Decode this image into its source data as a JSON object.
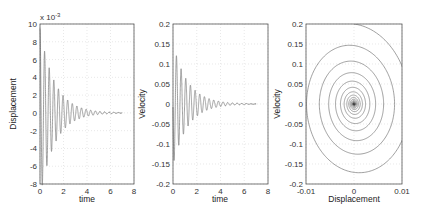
{
  "chart_data": [
    {
      "type": "line",
      "title": "",
      "xlabel": "time",
      "ylabel": "Displacement",
      "exponent_label": "x 10",
      "exponent": "-3",
      "xlim": [
        0,
        8
      ],
      "ylim": [
        -8,
        10
      ],
      "xticks": [
        "0",
        "2",
        "4",
        "6",
        "8"
      ],
      "yticks": [
        "-8",
        "-6",
        "-4",
        "-2",
        "0",
        "2",
        "4",
        "6",
        "8",
        "10"
      ],
      "grid": true,
      "series": [
        {
          "name": "displacement",
          "model": "damped_cos",
          "amplitude_e-3": 9.5,
          "omega": 16,
          "decay": 0.8,
          "t_end": 7
        }
      ]
    },
    {
      "type": "line",
      "title": "",
      "xlabel": "time",
      "ylabel": "Velocity",
      "xlim": [
        0,
        8
      ],
      "ylim": [
        -0.2,
        0.2
      ],
      "xticks": [
        "0",
        "2",
        "4",
        "6",
        "8"
      ],
      "yticks": [
        "-0.2",
        "-0.15",
        "-0.1",
        "-0.05",
        "0",
        "0.05",
        "0.1",
        "0.15",
        "0.2"
      ],
      "grid": true,
      "series": [
        {
          "name": "velocity",
          "model": "damped_sin_neg",
          "amplitude": 0.19,
          "omega": 16,
          "decay": 0.8,
          "t_end": 7
        }
      ]
    },
    {
      "type": "line",
      "title": "",
      "xlabel": "Displacement",
      "ylabel": "Velocity",
      "xlim": [
        -0.01,
        0.01
      ],
      "ylim": [
        -0.2,
        0.2
      ],
      "xticks": [
        "-0.01",
        "0",
        "0.01"
      ],
      "yticks": [
        "-0.2",
        "-0.15",
        "-0.1",
        "-0.05",
        "0",
        "0.05",
        "0.1",
        "0.15",
        "0.2"
      ],
      "grid": true,
      "series": [
        {
          "name": "phase-portrait",
          "model": "spiral",
          "start": [
            0,
            0.2
          ]
        }
      ]
    }
  ],
  "labels": {
    "p1_xlabel": "time",
    "p1_ylabel": "Displacement",
    "p1_exp": "x 10",
    "p1_exp_pow": "-3",
    "p2_xlabel": "time",
    "p2_ylabel": "Velocity",
    "p3_xlabel": "Displacement",
    "p3_ylabel": "Velocity"
  }
}
